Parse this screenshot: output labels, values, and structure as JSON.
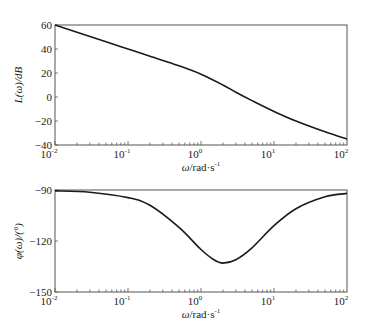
{
  "chart_data": [
    {
      "type": "line",
      "title": "",
      "xlabel": "ω/rad·s⁻¹",
      "ylabel": "L(ω)/dB",
      "xscale": "log",
      "xlim": [
        0.01,
        100
      ],
      "ylim": [
        -40,
        60
      ],
      "xticks": [
        "10^-2",
        "10^-1",
        "10^0",
        "10^1",
        "10^2"
      ],
      "yticks": [
        60,
        40,
        20,
        0,
        -20,
        -40
      ],
      "grid": false,
      "legend": null,
      "series": [
        {
          "name": "magnitude",
          "x": [
            0.01,
            0.02,
            0.05,
            0.1,
            0.2,
            0.5,
            1,
            2,
            3,
            5,
            10,
            20,
            50,
            100
          ],
          "y": [
            60,
            54,
            46,
            40,
            34,
            26,
            19,
            10,
            4,
            -3,
            -12,
            -20,
            -29,
            -35
          ]
        }
      ]
    },
    {
      "type": "line",
      "title": "",
      "xlabel": "ω/rad·s⁻¹",
      "ylabel": "φ(ω)/(°)",
      "xscale": "log",
      "xlim": [
        0.01,
        100
      ],
      "ylim": [
        -150,
        -90
      ],
      "xticks": [
        "10^-2",
        "10^-1",
        "10^0",
        "10^1",
        "10^2"
      ],
      "yticks": [
        -90,
        -120,
        -150
      ],
      "grid": false,
      "legend": null,
      "series": [
        {
          "name": "phase",
          "x": [
            0.01,
            0.03,
            0.1,
            0.2,
            0.5,
            1,
            1.5,
            2,
            3,
            5,
            10,
            20,
            50,
            100
          ],
          "y": [
            -90.5,
            -91.3,
            -94.5,
            -99,
            -112,
            -125,
            -131,
            -133,
            -131,
            -124,
            -111,
            -101,
            -94,
            -92
          ]
        }
      ]
    }
  ],
  "labels": {
    "top_ylabel": "L(ω)/dB",
    "bottom_ylabel": "φ(ω)/(°)",
    "xlabel_omega": "ω",
    "xlabel_unit": "/rad·s",
    "xlabel_exp": "-1"
  }
}
